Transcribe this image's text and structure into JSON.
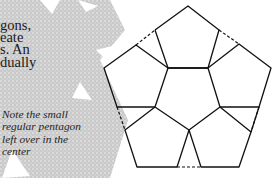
{
  "body_text": {
    "lines": [
      "gons,",
      "eate",
      "s. An",
      "dually"
    ]
  },
  "caption": {
    "lines": [
      "Note the small",
      "regular pentagon",
      "left over in the",
      "center"
    ]
  },
  "colors": {
    "background": "#ffffff",
    "texture": "#c8c8c8",
    "line": "#111111",
    "text": "#1a1a1a"
  }
}
